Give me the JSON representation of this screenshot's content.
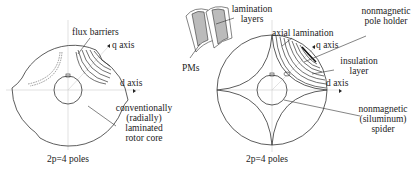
{
  "left_figure": {
    "labels": {
      "flux_barriers": "flux barriers",
      "q_axis": "q axis",
      "d_axis": "d axis",
      "core_line1": "conventionally",
      "core_line2": "(radially)",
      "core_line3": "laminated",
      "core_line4": "rotor core",
      "poles": "2p=4 poles"
    }
  },
  "right_figure": {
    "labels": {
      "lamination_layers_1": "lamination",
      "lamination_layers_2": "layers",
      "pms": "PMs",
      "axial_lamination": "axial lamination",
      "pole_holder_1": "nonmagnetic",
      "pole_holder_2": "pole holder",
      "q_axis": "q axis",
      "insulation_1": "insulation",
      "insulation_2": "layer",
      "d_axis": "d axis",
      "spider_1": "nonmagnetic",
      "spider_2": "(siluminum)",
      "spider_3": "spider",
      "poles": "2p=4 poles",
      "magnet_n": "N",
      "magnet_s": "S"
    }
  },
  "colors": {
    "line": "#333333",
    "axis": "#c8c8c8",
    "magnet_fill": "#b8b8b8"
  }
}
